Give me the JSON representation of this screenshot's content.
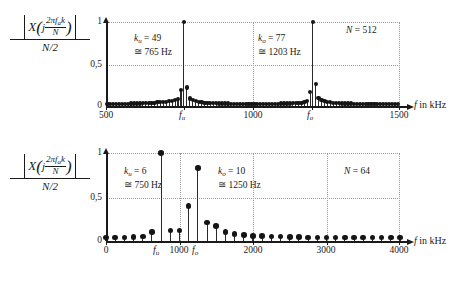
{
  "figure": {
    "y_axis_label": {
      "numerator_X": "X",
      "numerator_j": "j",
      "numerator_frac_top": "2πf k",
      "numerator_frac_top_plain": "2πf",
      "numerator_sub": "a",
      "numerator_k": "k",
      "numerator_frac_bottom": "N",
      "denominator": "N/2"
    },
    "x_axis_label_sym": "f",
    "x_axis_label_unit": "in kHz",
    "y_ticks": [
      "1",
      "0,5",
      "0"
    ],
    "y_tick_values": [
      1,
      0.5,
      0
    ]
  },
  "charts": [
    {
      "id": "top",
      "n_label_sym": "N",
      "n_label_eq": "= 512",
      "N": 512,
      "x_ticks": [
        "500",
        "1000",
        "1500"
      ],
      "x_tick_values": [
        500,
        1000,
        1500
      ],
      "xlim": [
        500,
        1500
      ],
      "ylim": [
        0,
        1
      ],
      "marker_labels": [
        {
          "name": "f",
          "sub": "u"
        },
        {
          "name": "f",
          "sub": "o"
        }
      ],
      "annotations": [
        {
          "line1_sym": "k",
          "line1_sub": "u",
          "line1_eq": "= 49",
          "line2": "≅ 765 Hz"
        },
        {
          "line1_sym": "k",
          "line1_sub": "o",
          "line1_eq": "= 77",
          "line2": "≅ 1203 Hz"
        }
      ]
    },
    {
      "id": "bottom",
      "n_label_sym": "N",
      "n_label_eq": "= 64",
      "N": 64,
      "x_ticks": [
        "0",
        "1000",
        "2000",
        "3000",
        "4000"
      ],
      "x_tick_values": [
        0,
        1000,
        2000,
        3000,
        4000
      ],
      "xlim": [
        0,
        4000
      ],
      "ylim": [
        0,
        1
      ],
      "marker_labels": [
        {
          "name": "f",
          "sub": "u"
        },
        {
          "name": "f",
          "sub": "o"
        }
      ],
      "annotations": [
        {
          "line1_sym": "k",
          "line1_sub": "u",
          "line1_eq": "= 6",
          "line2": "≅ 750 Hz"
        },
        {
          "line1_sym": "k",
          "line1_sub": "o",
          "line1_eq": "= 10",
          "line2": "≅ 1250 Hz"
        }
      ]
    }
  ],
  "chart_data": [
    {
      "type": "bar",
      "id": "top-spectrum-n512",
      "title": "DFT magnitude spectrum, N = 512",
      "xlabel": "f in kHz",
      "ylabel": "|X(j 2π f_a k / N)| / (N/2)",
      "xlim": [
        500,
        1500
      ],
      "ylim": [
        0,
        1
      ],
      "grid": true,
      "xticks": [
        500,
        1000,
        1500
      ],
      "yticks": [
        0,
        0.5,
        1
      ],
      "annotations": [
        {
          "text": "k_u = 49 ≅ 765 Hz",
          "x": 700,
          "y": 0.78
        },
        {
          "text": "k_o = 77 ≅ 1203 Hz",
          "x": 1040,
          "y": 0.78
        },
        {
          "text": "N = 512",
          "x": 1400,
          "y": 0.95
        },
        {
          "text": "f_u",
          "x": 765,
          "y": 0
        },
        {
          "text": "f_o",
          "x": 1203,
          "y": 0
        }
      ],
      "x": [
        505,
        515,
        525,
        535,
        545,
        555,
        565,
        575,
        585,
        595,
        605,
        615,
        625,
        635,
        645,
        655,
        665,
        675,
        685,
        695,
        705,
        715,
        725,
        735,
        745,
        755,
        765,
        775,
        785,
        795,
        805,
        815,
        825,
        835,
        845,
        855,
        865,
        875,
        885,
        895,
        905,
        915,
        925,
        935,
        945,
        955,
        965,
        975,
        985,
        995,
        1005,
        1015,
        1025,
        1035,
        1045,
        1055,
        1065,
        1075,
        1085,
        1095,
        1105,
        1115,
        1125,
        1135,
        1145,
        1155,
        1165,
        1175,
        1185,
        1195,
        1203,
        1213,
        1223,
        1233,
        1243,
        1253,
        1263,
        1273,
        1283,
        1293,
        1303,
        1313,
        1323,
        1333,
        1343,
        1353,
        1363,
        1373,
        1383,
        1393,
        1403,
        1413,
        1423,
        1433,
        1443,
        1453,
        1463,
        1473,
        1483,
        1493
      ],
      "values": [
        0.02,
        0.02,
        0.02,
        0.02,
        0.02,
        0.025,
        0.025,
        0.025,
        0.03,
        0.03,
        0.03,
        0.03,
        0.035,
        0.035,
        0.035,
        0.04,
        0.04,
        0.045,
        0.045,
        0.05,
        0.05,
        0.055,
        0.06,
        0.07,
        0.08,
        0.19,
        1.0,
        0.22,
        0.09,
        0.07,
        0.055,
        0.05,
        0.045,
        0.04,
        0.04,
        0.035,
        0.035,
        0.035,
        0.03,
        0.03,
        0.03,
        0.03,
        0.025,
        0.025,
        0.025,
        0.025,
        0.025,
        0.025,
        0.02,
        0.02,
        0.02,
        0.02,
        0.02,
        0.02,
        0.02,
        0.025,
        0.025,
        0.025,
        0.025,
        0.03,
        0.03,
        0.03,
        0.03,
        0.035,
        0.035,
        0.04,
        0.04,
        0.05,
        0.055,
        0.17,
        1.0,
        0.26,
        0.1,
        0.07,
        0.055,
        0.05,
        0.045,
        0.04,
        0.035,
        0.035,
        0.03,
        0.03,
        0.03,
        0.03,
        0.025,
        0.025,
        0.025,
        0.025,
        0.025,
        0.02,
        0.02,
        0.02,
        0.02,
        0.02,
        0.02,
        0.02,
        0.02,
        0.02,
        0.02,
        0.02
      ]
    },
    {
      "type": "bar",
      "id": "bottom-spectrum-n64",
      "title": "DFT magnitude spectrum, N = 64",
      "xlabel": "f in kHz",
      "ylabel": "|X(j 2π f_a k / N)| / (N/2)",
      "xlim": [
        0,
        4000
      ],
      "ylim": [
        0,
        1
      ],
      "grid": true,
      "xticks": [
        0,
        1000,
        2000,
        3000,
        4000
      ],
      "yticks": [
        0,
        0.5,
        1
      ],
      "annotations": [
        {
          "text": "k_u = 6 ≅ 750 Hz",
          "x": 330,
          "y": 0.78
        },
        {
          "text": "k_o = 10 ≅ 1250 Hz",
          "x": 1600,
          "y": 0.78
        },
        {
          "text": "N = 64",
          "x": 3450,
          "y": 0.88
        },
        {
          "text": "f_u",
          "x": 750,
          "y": 0
        },
        {
          "text": "f_o",
          "x": 1250,
          "y": 0
        }
      ],
      "x": [
        0,
        125,
        250,
        375,
        500,
        625,
        750,
        875,
        1000,
        1125,
        1250,
        1375,
        1500,
        1625,
        1750,
        1875,
        2000,
        2125,
        2250,
        2375,
        2500,
        2625,
        2750,
        2875,
        3000,
        3125,
        3250,
        3375,
        3500,
        3625,
        3750,
        3875,
        4000
      ],
      "values": [
        0.04,
        0.04,
        0.04,
        0.045,
        0.05,
        0.1,
        1.0,
        0.12,
        0.12,
        0.4,
        0.83,
        0.21,
        0.17,
        0.1,
        0.08,
        0.065,
        0.06,
        0.055,
        0.05,
        0.05,
        0.045,
        0.045,
        0.04,
        0.04,
        0.04,
        0.04,
        0.04,
        0.04,
        0.04,
        0.04,
        0.04,
        0.04,
        0.04
      ]
    }
  ]
}
